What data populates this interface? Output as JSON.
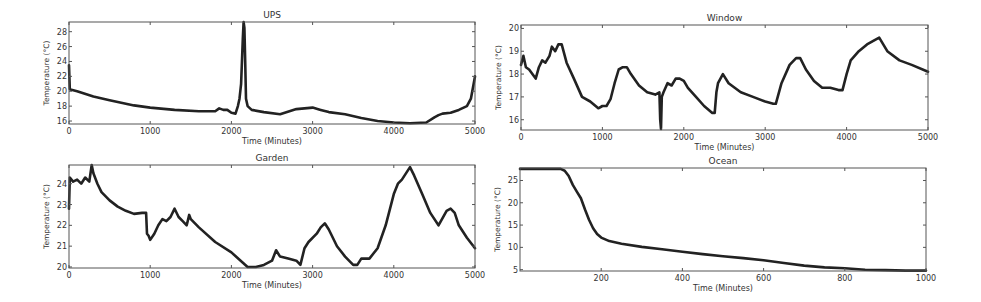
{
  "chart_data": [
    {
      "type": "line",
      "title": "UPS",
      "xlabel": "Time (Minutes)",
      "ylabel": "Temperature (°C)",
      "xlim": [
        0,
        5000
      ],
      "ylim": [
        15.6,
        29.3
      ],
      "xticks": [
        0,
        1000,
        2000,
        3000,
        4000,
        5000
      ],
      "yticks": [
        16,
        18,
        20,
        22,
        24,
        26,
        28
      ],
      "grid": false,
      "frame": {
        "left": 69,
        "top": 22,
        "right": 475,
        "bottom": 124
      },
      "x": [
        0,
        10,
        30,
        100,
        300,
        500,
        800,
        1000,
        1300,
        1600,
        1800,
        1850,
        1900,
        1950,
        2000,
        2050,
        2080,
        2100,
        2120,
        2140,
        2150,
        2160,
        2170,
        2180,
        2200,
        2250,
        2400,
        2600,
        2800,
        3000,
        3100,
        3200,
        3400,
        3600,
        3800,
        4000,
        4200,
        4400,
        4500,
        4550,
        4600,
        4700,
        4800,
        4900,
        4950,
        5000
      ],
      "y": [
        23.5,
        20.3,
        20.2,
        20.0,
        19.3,
        18.8,
        18.1,
        17.8,
        17.5,
        17.3,
        17.3,
        17.7,
        17.5,
        17.5,
        17.1,
        17.0,
        18.0,
        19.0,
        21.0,
        27.0,
        29.3,
        28.5,
        24.0,
        19.0,
        18.0,
        17.5,
        17.2,
        16.9,
        17.6,
        17.8,
        17.5,
        17.2,
        16.9,
        16.4,
        16.0,
        15.8,
        15.7,
        15.8,
        16.5,
        16.8,
        17.0,
        17.1,
        17.5,
        18.0,
        19.0,
        22.0
      ]
    },
    {
      "type": "line",
      "title": "Window",
      "xlabel": "Time (Minutes)",
      "ylabel": "Temperature (°C)",
      "xlim": [
        0,
        5000
      ],
      "ylim": [
        15.55,
        20.15
      ],
      "xticks": [
        0,
        1000,
        2000,
        3000,
        4000,
        5000
      ],
      "yticks": [
        16,
        17,
        18,
        19,
        20
      ],
      "grid": false,
      "frame": {
        "left": 521,
        "top": 25,
        "right": 928,
        "bottom": 130
      },
      "x": [
        0,
        30,
        60,
        100,
        180,
        220,
        260,
        300,
        350,
        380,
        420,
        460,
        500,
        560,
        650,
        750,
        850,
        950,
        1000,
        1050,
        1100,
        1150,
        1200,
        1250,
        1300,
        1350,
        1450,
        1550,
        1650,
        1700,
        1710,
        1720,
        1730,
        1750,
        1800,
        1850,
        1900,
        1950,
        2000,
        2050,
        2150,
        2250,
        2350,
        2380,
        2400,
        2420,
        2480,
        2550,
        2700,
        2850,
        3000,
        3100,
        3130,
        3200,
        3300,
        3380,
        3430,
        3500,
        3600,
        3700,
        3800,
        3900,
        3950,
        4000,
        4050,
        4150,
        4250,
        4350,
        4400,
        4500,
        4650,
        4800,
        5000
      ],
      "y": [
        18.4,
        18.8,
        18.3,
        18.2,
        17.8,
        18.3,
        18.6,
        18.5,
        18.8,
        19.2,
        19.0,
        19.3,
        19.3,
        18.5,
        17.8,
        17.0,
        16.8,
        16.5,
        16.6,
        16.6,
        16.9,
        17.6,
        18.2,
        18.3,
        18.3,
        18.0,
        17.5,
        17.2,
        17.1,
        17.2,
        16.0,
        15.6,
        17.0,
        17.2,
        17.6,
        17.5,
        17.8,
        17.8,
        17.7,
        17.4,
        17.0,
        16.6,
        16.3,
        16.3,
        17.2,
        17.6,
        18.0,
        17.6,
        17.2,
        17.0,
        16.8,
        16.7,
        16.7,
        17.6,
        18.4,
        18.7,
        18.7,
        18.2,
        17.7,
        17.4,
        17.4,
        17.3,
        17.3,
        18.0,
        18.6,
        19.0,
        19.3,
        19.5,
        19.6,
        19.0,
        18.6,
        18.4,
        18.1
      ]
    },
    {
      "type": "line",
      "title": "Garden",
      "xlabel": "Time (Minutes)",
      "ylabel": "Temperature (°C)",
      "xlim": [
        0,
        5000
      ],
      "ylim": [
        19.95,
        24.9
      ],
      "xticks": [
        0,
        1000,
        2000,
        3000,
        4000,
        5000
      ],
      "yticks": [
        20,
        21,
        22,
        23,
        24
      ],
      "grid": false,
      "frame": {
        "left": 69,
        "top": 165,
        "right": 475,
        "bottom": 268
      },
      "x": [
        0,
        10,
        50,
        100,
        150,
        200,
        250,
        280,
        300,
        350,
        400,
        500,
        600,
        700,
        800,
        900,
        950,
        960,
        980,
        1000,
        1050,
        1100,
        1150,
        1200,
        1250,
        1300,
        1350,
        1400,
        1450,
        1480,
        1500,
        1600,
        1800,
        2000,
        2200,
        2300,
        2400,
        2500,
        2550,
        2600,
        2700,
        2800,
        2850,
        2900,
        2950,
        3050,
        3100,
        3150,
        3200,
        3300,
        3400,
        3500,
        3550,
        3600,
        3700,
        3800,
        3900,
        4000,
        4050,
        4100,
        4200,
        4250,
        4350,
        4450,
        4550,
        4650,
        4700,
        4750,
        4800,
        4900,
        5000
      ],
      "y": [
        22.8,
        24.3,
        24.1,
        24.2,
        24.0,
        24.3,
        24.1,
        24.9,
        24.5,
        24.0,
        23.6,
        23.2,
        22.9,
        22.7,
        22.55,
        22.6,
        22.6,
        21.6,
        21.5,
        21.3,
        21.6,
        22.0,
        22.3,
        22.2,
        22.4,
        22.8,
        22.4,
        22.2,
        22.0,
        22.5,
        22.3,
        21.9,
        21.2,
        20.7,
        20.0,
        20.0,
        20.1,
        20.3,
        20.8,
        20.5,
        20.4,
        20.3,
        20.1,
        20.9,
        21.2,
        21.6,
        21.9,
        22.1,
        21.8,
        21.0,
        20.5,
        20.1,
        20.1,
        20.4,
        20.4,
        20.9,
        22.0,
        23.5,
        24.0,
        24.2,
        24.8,
        24.4,
        23.5,
        22.6,
        22.0,
        22.7,
        22.8,
        22.6,
        22.0,
        21.4,
        20.9
      ]
    },
    {
      "type": "line",
      "title": "Ocean",
      "xlabel": "Time (Minutes)",
      "ylabel": "Temperature (°C)",
      "xlim": [
        0,
        1000
      ],
      "ylim": [
        4.7,
        27.8
      ],
      "xticks": [
        200,
        400,
        600,
        800,
        1000
      ],
      "yticks": [
        5,
        10,
        15,
        20,
        25
      ],
      "grid": false,
      "frame": {
        "left": 520,
        "top": 168,
        "right": 926,
        "bottom": 271
      },
      "x": [
        0,
        100,
        110,
        120,
        130,
        140,
        150,
        160,
        170,
        180,
        190,
        200,
        220,
        250,
        300,
        350,
        400,
        450,
        500,
        550,
        600,
        650,
        700,
        750,
        800,
        850,
        900,
        950,
        1000
      ],
      "y": [
        27.6,
        27.6,
        27.2,
        26.0,
        24.0,
        22.5,
        21.0,
        18.5,
        16.2,
        14.3,
        13.0,
        12.2,
        11.4,
        10.8,
        10.1,
        9.6,
        9.0,
        8.5,
        8.0,
        7.6,
        7.1,
        6.5,
        5.9,
        5.5,
        5.3,
        5.0,
        4.9,
        4.8,
        4.8
      ]
    }
  ]
}
